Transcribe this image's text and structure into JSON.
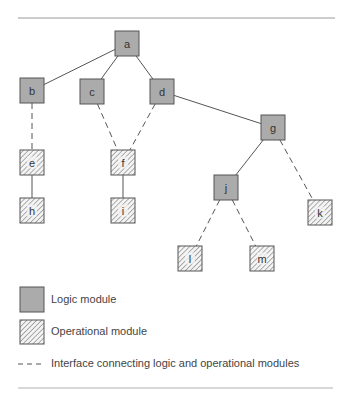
{
  "diagram": {
    "colors": {
      "logic_fill": "#ababab",
      "stroke": "#555555",
      "hatch": "#777777",
      "rule": "#9a9a9a",
      "text": "#333333"
    },
    "nodes": [
      {
        "id": "a",
        "label": "a",
        "type": "logic",
        "x": 115,
        "y": 31
      },
      {
        "id": "b",
        "label": "b",
        "type": "logic",
        "x": 20,
        "y": 78
      },
      {
        "id": "c",
        "label": "c",
        "type": "logic",
        "x": 80,
        "y": 79
      },
      {
        "id": "d",
        "label": "d",
        "type": "logic",
        "x": 150,
        "y": 79
      },
      {
        "id": "g",
        "label": "g",
        "type": "logic",
        "x": 261,
        "y": 115
      },
      {
        "id": "e",
        "label": "e",
        "type": "operational",
        "x": 20,
        "y": 150
      },
      {
        "id": "f",
        "label": "f",
        "type": "operational",
        "x": 111,
        "y": 150
      },
      {
        "id": "h",
        "label": "h",
        "type": "operational",
        "x": 20,
        "y": 198
      },
      {
        "id": "i",
        "label": "i",
        "type": "operational",
        "x": 111,
        "y": 198
      },
      {
        "id": "j",
        "label": "j",
        "type": "logic",
        "x": 214,
        "y": 175
      },
      {
        "id": "k",
        "label": "k",
        "type": "operational",
        "x": 308,
        "y": 200
      },
      {
        "id": "l",
        "label": "l",
        "type": "operational",
        "x": 178,
        "y": 246
      },
      {
        "id": "m",
        "label": "m",
        "type": "operational",
        "x": 250,
        "y": 246
      }
    ],
    "edges": [
      {
        "from": "a",
        "to": "b",
        "style": "solid"
      },
      {
        "from": "a",
        "to": "c",
        "style": "solid"
      },
      {
        "from": "a",
        "to": "d",
        "style": "solid"
      },
      {
        "from": "d",
        "to": "g",
        "style": "solid"
      },
      {
        "from": "g",
        "to": "j",
        "style": "solid"
      },
      {
        "from": "b",
        "to": "e",
        "style": "dashed"
      },
      {
        "from": "e",
        "to": "h",
        "style": "solid"
      },
      {
        "from": "c",
        "to": "f",
        "style": "dashed"
      },
      {
        "from": "d",
        "to": "f",
        "style": "dashed"
      },
      {
        "from": "f",
        "to": "i",
        "style": "solid"
      },
      {
        "from": "g",
        "to": "k",
        "style": "dashed"
      },
      {
        "from": "j",
        "to": "l",
        "style": "dashed"
      },
      {
        "from": "j",
        "to": "m",
        "style": "dashed"
      }
    ]
  },
  "legend": {
    "logic_label": "Logic module",
    "operational_label": "Operational module",
    "interface_label": "Interface connecting logic and operational modules"
  }
}
